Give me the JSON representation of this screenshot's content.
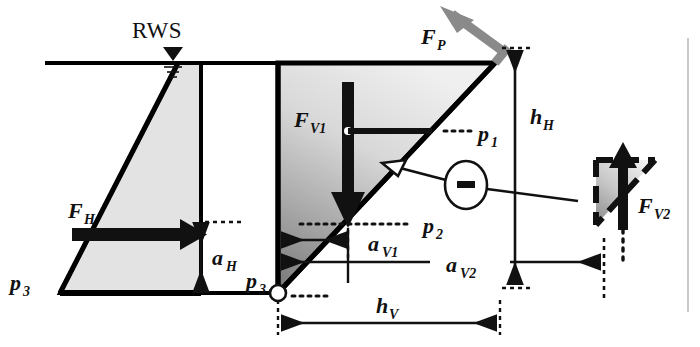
{
  "figure": {
    "type": "free-body force diagram",
    "water_table_label": "RWS"
  },
  "labels": {
    "rws": "RWS",
    "f_h": "F",
    "f_h_sub": "H",
    "f_v1": "F",
    "f_v1_sub": "V1",
    "f_v2": "F",
    "f_v2_sub": "V2",
    "f_p": "F",
    "f_p_sub": "P",
    "a_h": "a",
    "a_h_sub": "H",
    "a_v1": "a",
    "a_v1_sub": "V1",
    "a_v2": "a",
    "a_v2_sub": "V2",
    "h_h": "h",
    "h_h_sub": "H",
    "h_v": "h",
    "h_v_sub": "V",
    "p1": "p",
    "p1_sub": "1",
    "p2": "p",
    "p2_sub": "2",
    "p3_left": "p",
    "p3_left_sub": "3",
    "p3_right": "p",
    "p3_right_sub": "3",
    "minus_sign": "–"
  },
  "colors": {
    "ink": "#111111",
    "outline": "#000000",
    "fill_light": "#e3e3e3",
    "fill_wedge_top": "#ececec",
    "fill_wedge_bottom": "#8e8e8e",
    "arrow_gray": "#8a8a8a",
    "page_edge": "#c9c9c9",
    "background": "#ffffff"
  },
  "geometry": {
    "ground_line_y": 63,
    "base_line_y": 293,
    "left_triangle_apex_x": 178,
    "left_triangle_base_left_x": 60,
    "left_triangle_right_x": 201,
    "wedge_left_x": 278,
    "wedge_apex_x": 495,
    "wedge_apex_y": 57,
    "h_h_dim_x": 515,
    "h_v_dim_y": 323,
    "a_v2_dim_y": 262,
    "a_v1_dim_y": 240
  }
}
